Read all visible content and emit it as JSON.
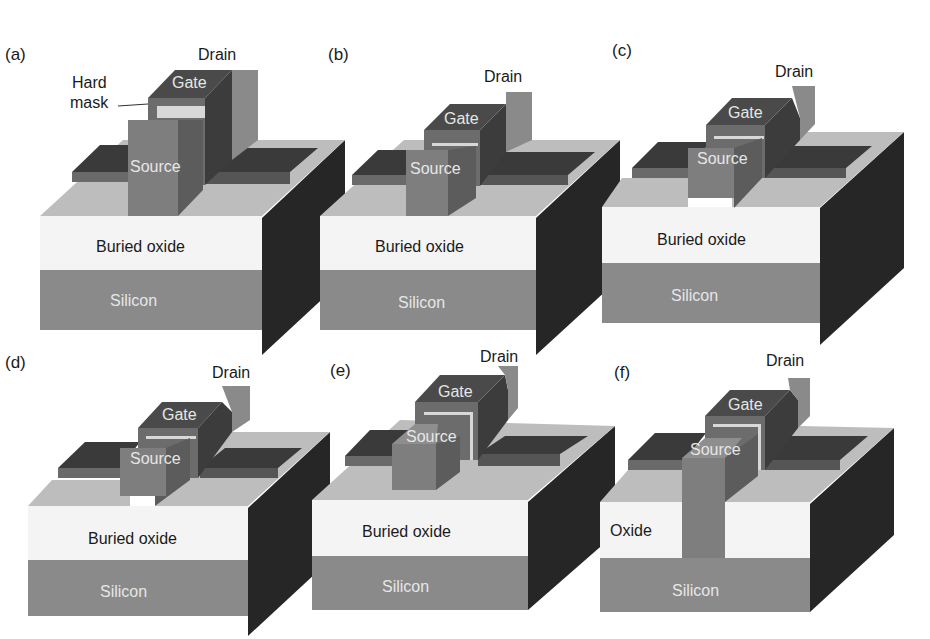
{
  "figure": {
    "colors": {
      "silicon": "#8a8a8a",
      "oxide_front": "#f4f4f4",
      "oxide_top": "#bdbdbd",
      "side_dark": "#262626",
      "gate_top": "#4a4a4a",
      "gate_front": "#6c6c6c",
      "gate_side": "#3c3c3c",
      "source_front": "#7e7e7e",
      "source_side": "#5c5c5c",
      "drain": "#7a7a7a",
      "hard_mask": "#d8d8d8"
    },
    "panels": [
      {
        "tag": "(a)",
        "drain": "Drain",
        "gate": "Gate",
        "source": "Source",
        "oxide": "Buried oxide",
        "substrate": "Silicon",
        "hard_mask": "Hard\nmask",
        "hard_mask_line1": "Hard",
        "hard_mask_line2": "mask"
      },
      {
        "tag": "(b)",
        "drain": "Drain",
        "gate": "Gate",
        "source": "Source",
        "oxide": "Buried oxide",
        "substrate": "Silicon"
      },
      {
        "tag": "(c)",
        "drain": "Drain",
        "gate": "Gate",
        "source": "Source",
        "oxide": "Buried oxide",
        "substrate": "Silicon"
      },
      {
        "tag": "(d)",
        "drain": "Drain",
        "gate": "Gate",
        "source": "Source",
        "oxide": "Buried oxide",
        "substrate": "Silicon"
      },
      {
        "tag": "(e)",
        "drain": "Drain",
        "gate": "Gate",
        "source": "Source",
        "oxide": "Buried oxide",
        "substrate": "Silicon"
      },
      {
        "tag": "(f)",
        "drain": "Drain",
        "gate": "Gate",
        "source": "Source",
        "oxide": "Oxide",
        "substrate": "Silicon"
      }
    ]
  }
}
